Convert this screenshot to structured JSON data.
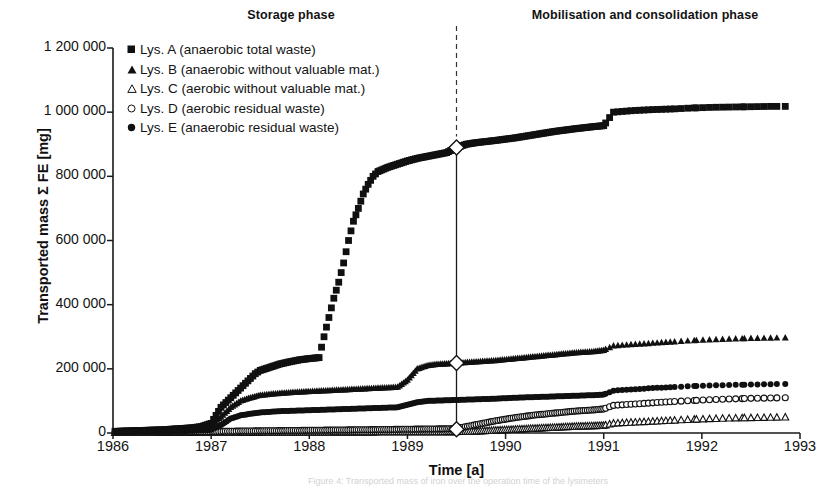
{
  "figure": {
    "phase_left_title": "Storage phase",
    "phase_right_title": "Mobilisation and consolidation phase",
    "caption_partial": "Figure 4: Transported mass of iron over the operation time of the lysimeters"
  },
  "chart_data": {
    "type": "scatter",
    "title": "",
    "xlabel": "Time [a]",
    "ylabel": "Transported mass Σ FE [mg]",
    "xlim": [
      1986,
      1993
    ],
    "ylim": [
      0,
      1200000
    ],
    "xticks": [
      1986,
      1987,
      1988,
      1989,
      1990,
      1991,
      1992,
      1993
    ],
    "xtick_labels": [
      "1986",
      "1987",
      "1988",
      "1989",
      "1990",
      "1991",
      "1992",
      "1993"
    ],
    "yticks": [
      0,
      200000,
      400000,
      600000,
      800000,
      1000000,
      1200000
    ],
    "ytick_labels": [
      "0",
      "200 000",
      "400 000",
      "600 000",
      "800 000",
      "1 000 000",
      "1 200 000"
    ],
    "grid": false,
    "legend_position": "upper-left-inside",
    "annotations": [
      {
        "text": "Storage phase",
        "x": 1987.8,
        "y": 1270000
      },
      {
        "text": "Mobilisation and consolidation phase",
        "x": 1991.3,
        "y": 1270000
      }
    ],
    "phase_divider": {
      "x": 1989.5,
      "style": "dashed",
      "label": "phase boundary"
    },
    "phase_connector": {
      "x": 1989.5,
      "style": "solid",
      "markers": "open-diamond",
      "marker_y_values": [
        890000,
        218000,
        12000
      ]
    },
    "series": [
      {
        "name": "Lys. A (anaerobic total waste)",
        "marker": "filled-square",
        "x": [
          1986.02,
          1986.1,
          1986.2,
          1986.3,
          1986.4,
          1986.5,
          1986.6,
          1986.7,
          1986.8,
          1986.9,
          1987.0,
          1987.05,
          1987.1,
          1987.15,
          1987.2,
          1987.25,
          1987.3,
          1987.35,
          1987.4,
          1987.45,
          1987.5,
          1987.6,
          1987.7,
          1987.8,
          1987.9,
          1988.0,
          1988.1,
          1988.15,
          1988.2,
          1988.25,
          1988.3,
          1988.35,
          1988.4,
          1988.45,
          1988.5,
          1988.55,
          1988.6,
          1988.65,
          1988.7,
          1988.8,
          1988.9,
          1989.0,
          1989.1,
          1989.2,
          1989.3,
          1989.4,
          1989.5,
          1989.6,
          1989.7,
          1989.9,
          1990.1,
          1990.3,
          1990.5,
          1990.7,
          1990.9,
          1991.0,
          1991.1,
          1991.3,
          1991.5,
          1991.7,
          1991.9,
          1992.1,
          1992.3,
          1992.5,
          1992.7,
          1992.85
        ],
        "y": [
          5000,
          6000,
          7000,
          8000,
          9000,
          10000,
          12000,
          14000,
          16000,
          20000,
          30000,
          55000,
          80000,
          95000,
          110000,
          125000,
          140000,
          155000,
          170000,
          185000,
          195000,
          205000,
          215000,
          222000,
          228000,
          232000,
          235000,
          300000,
          360000,
          420000,
          470000,
          530000,
          600000,
          660000,
          700000,
          745000,
          775000,
          800000,
          815000,
          828000,
          838000,
          848000,
          856000,
          862000,
          868000,
          874000,
          890000,
          900000,
          905000,
          912000,
          920000,
          930000,
          940000,
          948000,
          955000,
          958000,
          1000000,
          1005000,
          1008000,
          1010000,
          1013000,
          1015000,
          1016000,
          1017000,
          1018000,
          1018000
        ]
      },
      {
        "name": "Lys. B (anaerobic without valuable mat.)",
        "marker": "filled-triangle",
        "x": [
          1986.02,
          1986.2,
          1986.4,
          1986.6,
          1986.8,
          1987.0,
          1987.1,
          1987.2,
          1987.3,
          1987.4,
          1987.5,
          1987.7,
          1987.9,
          1988.1,
          1988.3,
          1988.5,
          1988.7,
          1988.9,
          1989.0,
          1989.1,
          1989.2,
          1989.3,
          1989.4,
          1989.5,
          1989.7,
          1989.9,
          1990.1,
          1990.3,
          1990.5,
          1990.7,
          1990.9,
          1991.0,
          1991.1,
          1991.3,
          1991.5,
          1991.7,
          1991.9,
          1992.1,
          1992.3,
          1992.5,
          1992.7,
          1992.85
        ],
        "y": [
          4000,
          5000,
          6000,
          8000,
          12000,
          25000,
          50000,
          80000,
          100000,
          110000,
          118000,
          124000,
          128000,
          131000,
          134000,
          137000,
          140000,
          143000,
          165000,
          200000,
          210000,
          214000,
          216000,
          218000,
          222000,
          226000,
          232000,
          238000,
          244000,
          250000,
          254000,
          258000,
          272000,
          276000,
          280000,
          284000,
          288000,
          291000,
          293000,
          295000,
          296000,
          297000
        ]
      },
      {
        "name": "Lys. C (aerobic without valuable mat.)",
        "marker": "open-triangle",
        "x": [
          1986.02,
          1986.3,
          1986.6,
          1986.9,
          1987.1,
          1987.3,
          1987.6,
          1987.9,
          1988.2,
          1988.5,
          1988.8,
          1989.1,
          1989.4,
          1989.5,
          1989.7,
          1989.9,
          1990.1,
          1990.3,
          1990.5,
          1990.7,
          1990.9,
          1991.0,
          1991.1,
          1991.3,
          1991.5,
          1991.7,
          1991.9,
          1992.1,
          1992.3,
          1992.5,
          1992.7,
          1992.85
        ],
        "y": [
          800,
          900,
          1000,
          1200,
          1500,
          1800,
          2000,
          2200,
          2400,
          2600,
          2800,
          3000,
          3200,
          3400,
          5000,
          8000,
          11000,
          14000,
          17000,
          20000,
          22000,
          23000,
          30000,
          33000,
          36000,
          39000,
          42000,
          44000,
          46000,
          47000,
          48000,
          49000
        ]
      },
      {
        "name": "Lys. D (aerobic residual waste)",
        "marker": "open-circle",
        "x": [
          1986.02,
          1986.3,
          1986.6,
          1986.9,
          1987.1,
          1987.3,
          1987.6,
          1987.9,
          1988.2,
          1988.5,
          1988.8,
          1989.1,
          1989.4,
          1989.5,
          1989.7,
          1989.9,
          1990.1,
          1990.3,
          1990.5,
          1990.7,
          1990.9,
          1991.0,
          1991.1,
          1991.3,
          1991.5,
          1991.7,
          1991.9,
          1992.1,
          1992.3,
          1992.5,
          1992.7,
          1992.85
        ],
        "y": [
          2000,
          2500,
          3000,
          3500,
          5000,
          6000,
          7000,
          8000,
          9000,
          10000,
          11000,
          12000,
          13000,
          14000,
          26000,
          38000,
          48000,
          56000,
          62000,
          68000,
          72000,
          75000,
          86000,
          90000,
          94000,
          98000,
          101000,
          104000,
          106000,
          108000,
          109000,
          110000
        ]
      },
      {
        "name": "Lys. E (anaerobic residual waste)",
        "marker": "filled-circle",
        "x": [
          1986.02,
          1986.2,
          1986.4,
          1986.6,
          1986.8,
          1987.0,
          1987.1,
          1987.2,
          1987.3,
          1987.4,
          1987.5,
          1987.7,
          1987.9,
          1988.1,
          1988.3,
          1988.5,
          1988.7,
          1988.9,
          1989.0,
          1989.1,
          1989.2,
          1989.3,
          1989.4,
          1989.5,
          1989.7,
          1989.9,
          1990.1,
          1990.3,
          1990.5,
          1990.7,
          1990.9,
          1991.0,
          1991.1,
          1991.3,
          1991.5,
          1991.7,
          1991.9,
          1992.1,
          1992.3,
          1992.5,
          1992.7,
          1992.85
        ],
        "y": [
          3000,
          3500,
          4000,
          5000,
          7000,
          10000,
          25000,
          45000,
          55000,
          60000,
          64000,
          68000,
          70000,
          72000,
          74000,
          76000,
          78000,
          80000,
          88000,
          96000,
          100000,
          101000,
          102000,
          103000,
          105000,
          107000,
          110000,
          112000,
          114000,
          116000,
          118000,
          120000,
          132000,
          136000,
          140000,
          143000,
          146000,
          148000,
          150000,
          151000,
          152000,
          153000
        ]
      }
    ]
  },
  "colors": {
    "ink": "#131313",
    "axis": "#1a1a1a",
    "background": "#ffffff"
  }
}
